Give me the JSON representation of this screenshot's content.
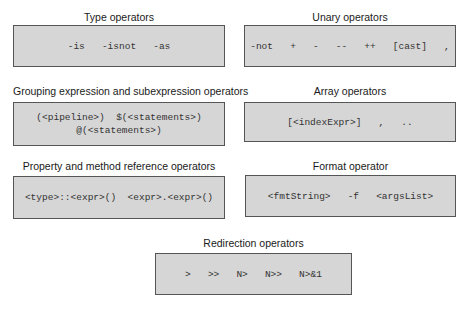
{
  "groups": [
    {
      "id": "type",
      "title": "Type operators",
      "lines": [
        "-is   -isnot   -as"
      ]
    },
    {
      "id": "unary",
      "title": "Unary operators",
      "lines": [
        "-not   +   -   --   ++   [cast]   ,"
      ]
    },
    {
      "id": "grouping",
      "title": "Grouping expression and subexpression operators",
      "lines": [
        "(<pipeline>)  $(<statements>)",
        "@(<statements>)"
      ]
    },
    {
      "id": "array",
      "title": "Array operators",
      "lines": [
        "[<indexExpr>]   ,   .."
      ]
    },
    {
      "id": "property",
      "title": "Property and method reference operators",
      "lines": [
        "<type>::<expr>()  <expr>.<expr>()"
      ]
    },
    {
      "id": "format",
      "title": "Format operator",
      "lines": [
        "<fmtString>   -f   <argsList>"
      ]
    },
    {
      "id": "redirection",
      "title": "Redirection operators",
      "lines": [
        ">   >>   N>   N>>   N>&1"
      ]
    }
  ]
}
